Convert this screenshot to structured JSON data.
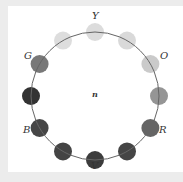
{
  "diagram": {
    "title": "",
    "center_label": "n",
    "circle": {
      "cx": 95,
      "cy": 96,
      "r": 64,
      "stroke": "#666666"
    },
    "disc_radius": 9,
    "discs": [
      {
        "angle_deg": 90,
        "fill": "#d9d9d9",
        "label": "Y"
      },
      {
        "angle_deg": 60,
        "fill": "#d6d6d6",
        "label": ""
      },
      {
        "angle_deg": 30,
        "fill": "#c6c6c6",
        "label": "O"
      },
      {
        "angle_deg": 0,
        "fill": "#8c8c8c",
        "label": ""
      },
      {
        "angle_deg": -30,
        "fill": "#585858",
        "label": "R"
      },
      {
        "angle_deg": -60,
        "fill": "#353535",
        "label": ""
      },
      {
        "angle_deg": -90,
        "fill": "#2b2b2b",
        "label": "V"
      },
      {
        "angle_deg": -120,
        "fill": "#343434",
        "label": ""
      },
      {
        "angle_deg": -150,
        "fill": "#363636",
        "label": "B"
      },
      {
        "angle_deg": 180,
        "fill": "#222222",
        "label": ""
      },
      {
        "angle_deg": 150,
        "fill": "#6c6c6c",
        "label": "G"
      },
      {
        "angle_deg": 120,
        "fill": "#dadada",
        "label": ""
      }
    ],
    "labels": {
      "Y": "Y",
      "O": "O",
      "R": "R",
      "V": "V",
      "B": "B",
      "G": "G"
    }
  }
}
